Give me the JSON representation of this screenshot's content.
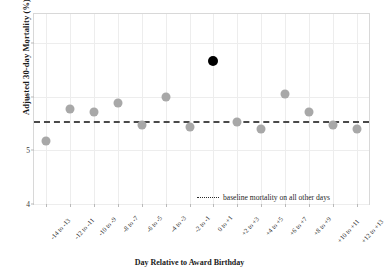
{
  "chart_data": {
    "type": "scatter",
    "title": "",
    "xlabel": "Day Relative to Award Birthday",
    "ylabel": "Adjusted 30-day Mortality (%)",
    "categories": [
      "-14 to -13",
      "-12 to -11",
      "-10 to -9",
      "-8 to -7",
      "-6 to -5",
      "-4 to -3",
      "-2 to -1",
      "0 to +1",
      "+2 to +3",
      "+4 to +5",
      "+6 to +7",
      "+8 to +9",
      "+10 to +11",
      "+12 to +13"
    ],
    "values": [
      5.17,
      5.78,
      5.72,
      5.88,
      5.47,
      6.0,
      5.43,
      6.68,
      5.54,
      5.4,
      6.05,
      5.72,
      5.47,
      5.41
    ],
    "highlight_index": 7,
    "highlight_color": "#000000",
    "point_color": "#a8a8a8",
    "baseline_value": 5.55,
    "baseline_color": "#4a4a4a",
    "ylim": [
      4,
      7.55
    ],
    "yticks": [
      "4",
      "5",
      "6",
      "7"
    ],
    "ytick_values": [
      4,
      5,
      6,
      7
    ],
    "grid": true,
    "legend": {
      "position": "inside-bottom-right",
      "entries": [
        {
          "label": "baseline mortality on all other days",
          "style": "dotted-line"
        }
      ]
    }
  }
}
